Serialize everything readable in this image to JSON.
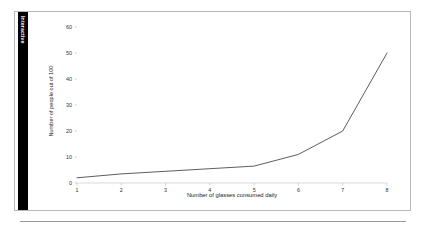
{
  "card": {
    "tab_label": "Interactive"
  },
  "chart_data": {
    "type": "line",
    "title": "",
    "xlabel": "Number of glasses consumed daily",
    "ylabel": "Number of people out of 100",
    "x": [
      1,
      2,
      3,
      4,
      5,
      6,
      7,
      8
    ],
    "values": [
      2,
      3.5,
      4.5,
      5.5,
      6.5,
      11,
      20,
      50
    ],
    "xtick_labels": [
      "1",
      "2",
      "3",
      "4",
      "5",
      "6",
      "7",
      "8"
    ],
    "ytick_labels": [
      "0",
      "10",
      "20",
      "30",
      "40",
      "50",
      "60"
    ],
    "yticks": [
      0,
      10,
      20,
      30,
      40,
      50,
      60
    ],
    "xlim": [
      1,
      8
    ],
    "ylim": [
      0,
      60
    ],
    "grid": false,
    "legend": false,
    "line_color": "#4a4a52",
    "axis_color": "#c8c8c8"
  }
}
